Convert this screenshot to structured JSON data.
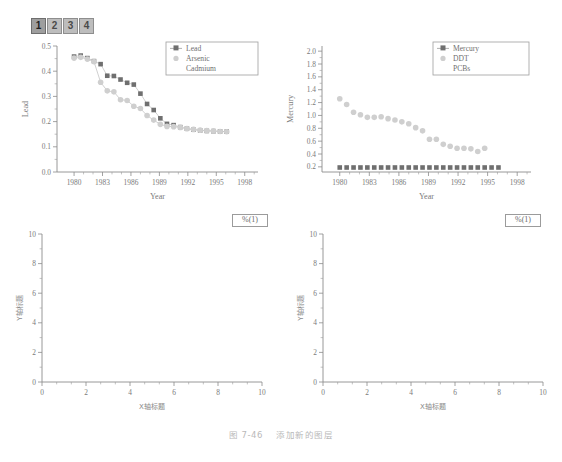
{
  "layer_tabs": {
    "name": "layer-tab-bar",
    "items": [
      {
        "label": "1",
        "active": true
      },
      {
        "label": "2",
        "active": false
      },
      {
        "label": "3",
        "active": false
      },
      {
        "label": "4",
        "active": false
      }
    ]
  },
  "floating_labels": {
    "left": "%(1)",
    "right": "%(1)"
  },
  "caption": {
    "number": "图 7-46",
    "text": "添加新的图层"
  },
  "colors": {
    "marker_dark": "#6f6f6f",
    "marker_light": "#cfcfcf",
    "axis": "#8c8c8c",
    "text": "#7a7a7a",
    "tab_active": "#9e9e9e",
    "tab_inactive": "#bdbdbd"
  },
  "chart_data": [
    {
      "id": "top-left",
      "type": "scatter",
      "title": "",
      "xlabel": "Year",
      "ylabel": "Lead",
      "xlim": [
        1978.2,
        1999.4
      ],
      "ylim": [
        0.0,
        0.5
      ],
      "xticks": [
        1980,
        1983,
        1986,
        1989,
        1992,
        1995,
        1998
      ],
      "yticks": [
        0.0,
        0.1,
        0.2,
        0.3,
        0.4,
        0.5
      ],
      "grid": false,
      "legend_position": "top-right",
      "legend": [
        "Lead",
        "Arsenic",
        "Cadmium"
      ],
      "x": [
        1980.0,
        1980.7,
        1981.4,
        1982.1,
        1982.8,
        1983.5,
        1984.2,
        1984.9,
        1985.6,
        1986.3,
        1987.0,
        1987.7,
        1988.4,
        1989.1,
        1989.8,
        1990.5,
        1991.2,
        1991.9,
        1992.6,
        1993.3,
        1994.0,
        1994.7,
        1995.4,
        1996.1
      ],
      "series": [
        {
          "name": "Lead",
          "marker": "filled-square",
          "color": "#6f6f6f",
          "values": [
            0.458,
            0.462,
            0.452,
            0.44,
            0.428,
            0.382,
            0.381,
            0.367,
            0.354,
            0.347,
            0.311,
            0.27,
            0.246,
            0.213,
            0.191,
            0.186,
            0.178,
            0.172,
            0.168,
            0.165,
            0.163,
            0.162,
            0.161,
            0.16
          ]
        },
        {
          "name": "Arsenic",
          "marker": "filled-circle",
          "color": "#cfcfcf",
          "values": [
            0.452,
            0.455,
            0.448,
            0.438,
            0.356,
            0.322,
            0.318,
            0.287,
            0.284,
            0.261,
            0.252,
            0.224,
            0.206,
            0.189,
            0.181,
            0.18,
            0.177,
            0.172,
            0.169,
            0.166,
            0.164,
            0.163,
            0.161,
            0.16
          ]
        },
        {
          "name": "Cadmium",
          "marker": "none",
          "color": "#cfcfcf",
          "values": []
        }
      ]
    },
    {
      "id": "top-right",
      "type": "scatter",
      "title": "",
      "xlabel": "Year",
      "ylabel": "Mercury",
      "xlim": [
        1978.2,
        1999.4
      ],
      "ylim": [
        0.12,
        2.08
      ],
      "xticks": [
        1980,
        1983,
        1986,
        1989,
        1992,
        1995,
        1998
      ],
      "yticks": [
        0.2,
        0.4,
        0.6,
        0.8,
        1.0,
        1.2,
        1.4,
        1.6,
        1.8,
        2.0
      ],
      "grid": false,
      "legend_position": "top-right",
      "legend": [
        "Mercury",
        "DDT",
        "PCBs"
      ],
      "x": [
        1980.0,
        1980.7,
        1981.4,
        1982.1,
        1982.8,
        1983.5,
        1984.2,
        1984.9,
        1985.6,
        1986.3,
        1987.0,
        1987.7,
        1988.4,
        1989.1,
        1989.8,
        1990.5,
        1991.2,
        1991.9,
        1992.6,
        1993.3,
        1994.0,
        1994.7,
        1995.4,
        1996.1
      ],
      "series": [
        {
          "name": "Mercury",
          "marker": "filled-square",
          "color": "#6f6f6f",
          "values": [
            0.19,
            0.19,
            0.19,
            0.19,
            0.19,
            0.19,
            0.19,
            0.19,
            0.19,
            0.19,
            0.19,
            0.19,
            0.19,
            0.19,
            0.19,
            0.19,
            0.19,
            0.19,
            0.19,
            0.19,
            0.19,
            0.19,
            0.19,
            0.19
          ]
        },
        {
          "name": "DDT",
          "marker": "filled-circle",
          "color": "#cfcfcf",
          "values": [
            1.26,
            1.17,
            1.05,
            1.01,
            0.97,
            0.97,
            0.98,
            0.95,
            0.93,
            0.9,
            0.87,
            0.81,
            0.76,
            0.63,
            0.63,
            0.55,
            0.52,
            0.49,
            0.49,
            0.48,
            0.44,
            0.49,
            null,
            null
          ]
        },
        {
          "name": "PCBs",
          "marker": "none",
          "color": "#cfcfcf",
          "values": []
        }
      ]
    },
    {
      "id": "bottom-left",
      "type": "scatter",
      "title": "",
      "xlabel": "X轴标题",
      "ylabel": "Y轴标题",
      "xlim": [
        0,
        10
      ],
      "ylim": [
        0,
        10
      ],
      "xticks": [
        0,
        2,
        4,
        6,
        8,
        10
      ],
      "yticks": [
        0,
        2,
        4,
        6,
        8,
        10
      ],
      "grid": false,
      "legend": [],
      "series": []
    },
    {
      "id": "bottom-right",
      "type": "scatter",
      "title": "",
      "xlabel": "X轴标题",
      "ylabel": "Y轴标题",
      "xlim": [
        0,
        10
      ],
      "ylim": [
        0,
        10
      ],
      "xticks": [
        0,
        2,
        4,
        6,
        8,
        10
      ],
      "yticks": [
        0,
        2,
        4,
        6,
        8,
        10
      ],
      "grid": false,
      "legend": [],
      "series": []
    }
  ]
}
